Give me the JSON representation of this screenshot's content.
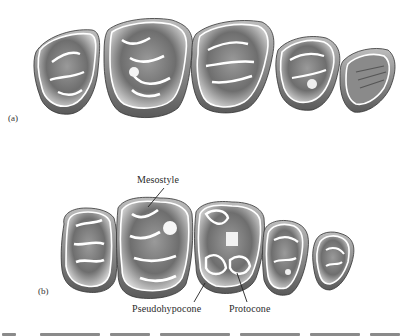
{
  "figure": {
    "panels": [
      {
        "id": "a",
        "label": "(a)",
        "tooth_count": 5
      },
      {
        "id": "b",
        "label": "(b)",
        "tooth_count": 5
      }
    ],
    "annotations": {
      "mesostyle": "Mesostyle",
      "pseudohypocone": "Pseudohypocone",
      "protocone": "Protocone"
    },
    "caption_visible": false
  }
}
